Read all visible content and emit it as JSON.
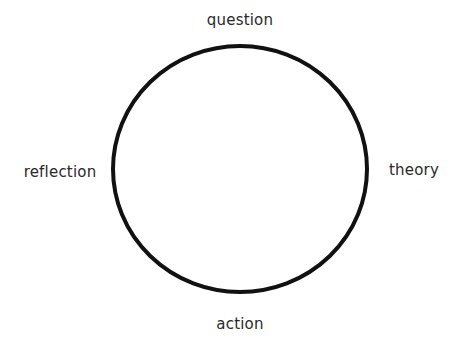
{
  "diagram": {
    "type": "cycle",
    "shape": "circle",
    "stroke_color": "#111111",
    "nodes": [
      {
        "id": "top",
        "label": "question"
      },
      {
        "id": "right",
        "label": "theory"
      },
      {
        "id": "bottom",
        "label": "action"
      },
      {
        "id": "left",
        "label": "reflection"
      }
    ]
  }
}
